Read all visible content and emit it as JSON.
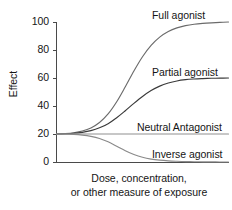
{
  "chart_data": {
    "type": "line",
    "title": "",
    "xlabel": "Dose, concentration, or other measure of exposure",
    "xlabel_lines": [
      "Dose, concentration,",
      "or other measure of exposure"
    ],
    "ylabel": "Effect",
    "ylim": [
      0,
      100
    ],
    "yticks": [
      0,
      20,
      40,
      60,
      80,
      100
    ],
    "ytick_labels": [
      "0",
      "20",
      "40",
      "60",
      "80",
      "100"
    ],
    "xticks": [],
    "xtick_labels": [],
    "grid": false,
    "legend_position": "inline-annotations",
    "baseline_effect": 20,
    "series": [
      {
        "name": "Full agonist",
        "color": "#6b6b6b",
        "baseline": 20,
        "plateau": 100,
        "x": [
          0,
          5,
          10,
          15,
          20,
          25,
          30,
          35,
          40,
          45,
          50,
          55,
          60,
          65,
          70,
          75,
          80,
          85,
          90,
          95,
          100
        ],
        "values": [
          20,
          20.3,
          20.9,
          22.1,
          24.3,
          28.2,
          34.3,
          43.0,
          53.7,
          65.0,
          75.2,
          83.3,
          89.2,
          93.2,
          95.8,
          97.4,
          98.4,
          99.0,
          99.4,
          99.7,
          100
        ]
      },
      {
        "name": "Partial agonist",
        "color": "#3a3a3a",
        "baseline": 20,
        "plateau": 60,
        "x": [
          0,
          5,
          10,
          15,
          20,
          25,
          30,
          35,
          40,
          45,
          50,
          55,
          60,
          65,
          70,
          75,
          80,
          85,
          90,
          95,
          100
        ],
        "values": [
          20,
          20.2,
          20.5,
          21.2,
          22.4,
          24.4,
          27.4,
          31.6,
          36.6,
          41.9,
          46.8,
          51.0,
          54.2,
          56.4,
          57.9,
          58.8,
          59.3,
          59.6,
          59.8,
          59.9,
          60
        ]
      },
      {
        "name": "Neutral Antagonist",
        "color": "#8f8f8f",
        "baseline": 20,
        "plateau": 20,
        "x": [
          0,
          25,
          50,
          75,
          100
        ],
        "values": [
          20,
          20,
          20,
          20,
          20
        ]
      },
      {
        "name": "Inverse agonist",
        "color": "#8a8a8a",
        "baseline": 20,
        "plateau": 0,
        "x": [
          0,
          5,
          10,
          15,
          20,
          25,
          30,
          35,
          40,
          45,
          50,
          55,
          60,
          65,
          70,
          75,
          80,
          85,
          90,
          95,
          100
        ],
        "values": [
          20,
          19.9,
          19.7,
          19.2,
          18.3,
          16.8,
          14.4,
          11.3,
          8.1,
          5.4,
          3.4,
          2.1,
          1.3,
          0.8,
          0.5,
          0.3,
          0.2,
          0.1,
          0.06,
          0.03,
          0
        ]
      }
    ],
    "annotations": [
      {
        "text": "Full agonist",
        "series": "Full agonist"
      },
      {
        "text": "Partial agonist",
        "series": "Partial agonist"
      },
      {
        "text": "Neutral Antagonist",
        "series": "Neutral Antagonist"
      },
      {
        "text": "Inverse agonist",
        "series": "Inverse agonist"
      }
    ]
  },
  "axis": {
    "y_label": "Effect",
    "tick_0": "0",
    "tick_20": "20",
    "tick_40": "40",
    "tick_60": "60",
    "tick_80": "80",
    "tick_100": "100",
    "x_label_line1": "Dose, concentration,",
    "x_label_line2": "or other measure of exposure"
  },
  "labels": {
    "full_agonist": "Full agonist",
    "partial_agonist": "Partial agonist",
    "neutral_antagonist": "Neutral Antagonist",
    "inverse_agonist": "Inverse agonist"
  },
  "colors": {
    "axis": "#4a4a4a",
    "text": "#151515",
    "full_agonist": "#6b6b6b",
    "partial_agonist": "#3a3a3a",
    "neutral_antagonist": "#8f8f8f",
    "inverse_agonist": "#8a8a8a",
    "background": "#ffffff"
  }
}
